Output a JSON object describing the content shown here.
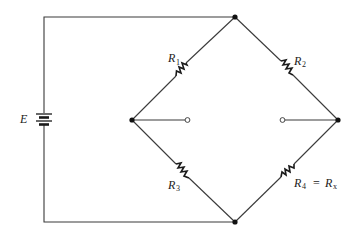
{
  "diagram": {
    "type": "circuit",
    "name": "Wheatstone bridge",
    "source": {
      "label": "E"
    },
    "resistors": [
      {
        "id": "R1",
        "symbol": "R",
        "subscript": "1"
      },
      {
        "id": "R2",
        "symbol": "R",
        "subscript": "2"
      },
      {
        "id": "R3",
        "symbol": "R",
        "subscript": "3"
      },
      {
        "id": "R4",
        "symbol": "R",
        "subscript": "4",
        "equals": "=",
        "alias_symbol": "R",
        "alias_subscript": "x"
      }
    ],
    "nodes": [
      "top",
      "left",
      "right",
      "bottom"
    ],
    "terminals": [
      "left-open-terminal",
      "right-open-terminal"
    ],
    "colors": {
      "line": "#3a3a3a",
      "background": "#ffffff"
    }
  }
}
